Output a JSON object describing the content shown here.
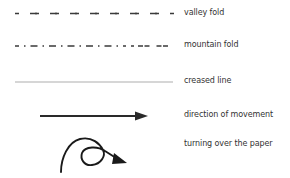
{
  "legend": {
    "items": [
      {
        "key": "valley_fold",
        "label": "valley fold",
        "line_style": "dashed"
      },
      {
        "key": "mountain_fold",
        "label": "mountain fold",
        "line_style": "dash-dot"
      },
      {
        "key": "creased_line",
        "label": "creased line",
        "line_style": "thin-solid"
      },
      {
        "key": "direction_of_movement",
        "label": "direction of  movement",
        "line_style": "arrow"
      },
      {
        "key": "turning_over_the_paper",
        "label": "turning over the paper",
        "line_style": "loop-arrow"
      }
    ]
  },
  "colors": {
    "line": "#3a3a3a",
    "crease": "#8a8a8a",
    "text": "#333333",
    "background": "#ffffff"
  }
}
